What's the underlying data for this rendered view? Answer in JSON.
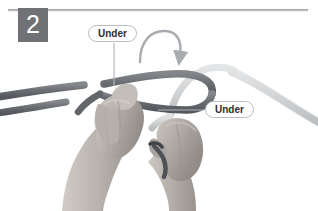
{
  "figure": {
    "step_number": "2",
    "background_color": "#ffffff",
    "width": 318,
    "height": 211,
    "top_rule_color": "#8d9094",
    "badge_color": "#6f7174",
    "badge_text_color": "#ffffff"
  },
  "callouts": [
    {
      "id": "under-top",
      "label": "Under",
      "leader": "vertical-down"
    },
    {
      "id": "under-right",
      "label": "Under",
      "leader": "horizontal-left"
    }
  ],
  "annotations": {
    "arrow": {
      "name": "curved-direction-arrow",
      "color": "#a8abaf",
      "direction": "clockwise-over-down-right"
    }
  },
  "ropes": [
    {
      "id": "dark-rope",
      "color": "#6b6e72",
      "shade": "dark",
      "description": "dark gray cord entering from left edge, forming a bight loop at center"
    },
    {
      "id": "light-rope",
      "color": "#d3d5d7",
      "shade": "light",
      "description": "pale gray cord arching over from center to right edge"
    }
  ],
  "hands": [
    {
      "id": "left-hand",
      "skin_color": "#b9b3ae",
      "description": "left hand pinching the crossing point of both cords"
    },
    {
      "id": "right-hand",
      "skin_color": "#b2aca7",
      "description": "right hand gripping the working end below the crossing"
    }
  ]
}
